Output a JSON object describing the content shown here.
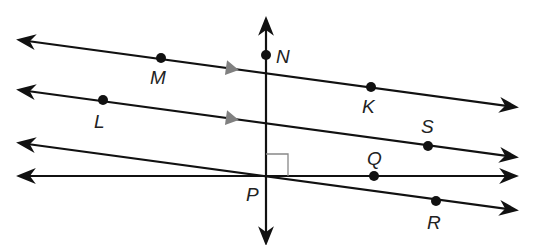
{
  "diagram": {
    "title": "",
    "colors": {
      "line": "#111111",
      "marker": "#808080",
      "right_angle": "#888888"
    },
    "points": [
      {
        "name": "N",
        "label": "N",
        "x": 266,
        "y": 55,
        "lx": 276,
        "ly": 63
      },
      {
        "name": "M",
        "label": "M",
        "x": 161,
        "y": 58,
        "lx": 150,
        "ly": 84
      },
      {
        "name": "K",
        "label": "K",
        "x": 371,
        "y": 87,
        "lx": 362,
        "ly": 113
      },
      {
        "name": "L",
        "label": "L",
        "x": 103,
        "y": 100,
        "lx": 94,
        "ly": 128
      },
      {
        "name": "S",
        "label": "S",
        "x": 428,
        "y": 146,
        "lx": 421,
        "ly": 133
      },
      {
        "name": "Q",
        "label": "Q",
        "x": 374,
        "y": 176,
        "lx": 367,
        "ly": 165
      },
      {
        "name": "P",
        "label": "P",
        "x": 266,
        "y": 176,
        "lx": 246,
        "ly": 201
      },
      {
        "name": "R",
        "label": "R",
        "x": 436,
        "y": 201,
        "lx": 427,
        "ly": 229
      }
    ],
    "lines": [
      {
        "name": "line-MK",
        "x1": 20,
        "y1": 40,
        "x2": 515,
        "y2": 107
      },
      {
        "name": "line-LS",
        "x1": 20,
        "y1": 90,
        "x2": 515,
        "y2": 157
      },
      {
        "name": "line-PR",
        "x1": 20,
        "y1": 143,
        "x2": 515,
        "y2": 210
      },
      {
        "name": "line-PQ",
        "x1": 20,
        "y1": 176,
        "x2": 515,
        "y2": 176
      },
      {
        "name": "line-NP",
        "x1": 266,
        "y1": 20,
        "x2": 266,
        "y2": 242
      }
    ],
    "parallel_markers": [
      {
        "x": 232,
        "y": 68
      },
      {
        "x": 232,
        "y": 118
      }
    ],
    "right_angle": {
      "vertex": "P",
      "x": 266,
      "y": 176,
      "size": 22
    }
  }
}
